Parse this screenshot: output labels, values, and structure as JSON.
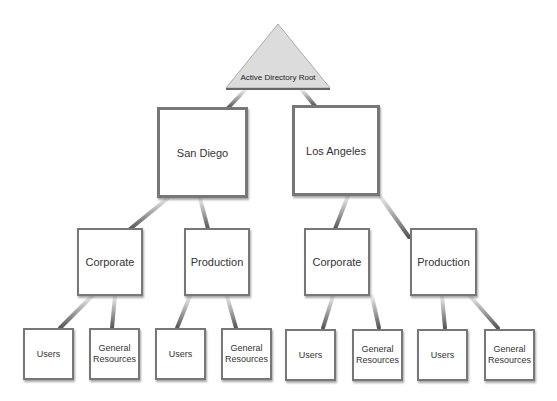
{
  "diagram": {
    "root": {
      "label": "Active Directory Root"
    },
    "sites": [
      {
        "label": "San Diego",
        "children": [
          {
            "label": "Corporate",
            "children": [
              {
                "label": "Users"
              },
              {
                "label": "General Resources"
              }
            ]
          },
          {
            "label": "Production",
            "children": [
              {
                "label": "Users"
              },
              {
                "label": "General Resources"
              }
            ]
          }
        ]
      },
      {
        "label": "Los Angeles",
        "children": [
          {
            "label": "Corporate",
            "children": [
              {
                "label": "Users"
              },
              {
                "label": "General Resources"
              }
            ]
          },
          {
            "label": "Production",
            "children": [
              {
                "label": "Users"
              },
              {
                "label": "General Resources"
              }
            ]
          }
        ]
      }
    ]
  }
}
